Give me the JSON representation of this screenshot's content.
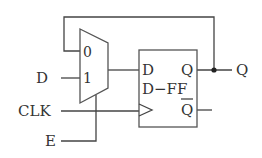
{
  "diagram": {
    "type": "circuit",
    "inputs": [
      {
        "id": "D",
        "label": "D"
      },
      {
        "id": "CLK",
        "label": "CLK"
      },
      {
        "id": "E",
        "label": "E"
      }
    ],
    "outputs": [
      {
        "id": "Q",
        "label": "Q"
      }
    ],
    "mux": {
      "input0_label": "0",
      "input1_label": "1"
    },
    "flipflop": {
      "name": "D−FF",
      "d_label": "D",
      "q_label": "Q",
      "qbar_label": "Q"
    }
  }
}
